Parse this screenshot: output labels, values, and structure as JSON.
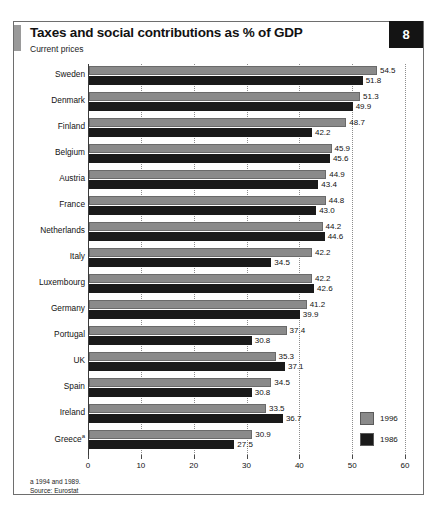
{
  "header": {
    "title": "Taxes and social contributions as % of GDP",
    "subtitle": "Current prices",
    "badge": "8"
  },
  "legend": {
    "items": [
      {
        "label": "1996",
        "color": "#8a8a8a"
      },
      {
        "label": "1986",
        "color": "#1a1a1a"
      }
    ]
  },
  "footnotes": {
    "note_a": "a  1994 and 1989.",
    "source": "Source: Eurostat"
  },
  "chart_data": {
    "type": "bar",
    "orientation": "horizontal",
    "title": "Taxes and social contributions as % of GDP",
    "subtitle": "Current prices",
    "xlabel": "",
    "ylabel": "",
    "xlim": [
      0,
      60
    ],
    "xticks": [
      0,
      10,
      20,
      30,
      40,
      50,
      60
    ],
    "grid": true,
    "grid_axis": "x",
    "legend_position": "bottom-right",
    "categories": [
      "Sweden",
      "Denmark",
      "Finland",
      "Belgium",
      "Austria",
      "France",
      "Netherlands",
      "Italy",
      "Luxembourg",
      "Germany",
      "Portugal",
      "UK",
      "Spain",
      "Ireland",
      "Greece"
    ],
    "category_footnote_marks": {
      "Greece": "a"
    },
    "series": [
      {
        "name": "1996",
        "color": "#8a8a8a",
        "values": [
          54.5,
          51.3,
          48.7,
          45.9,
          44.9,
          44.8,
          44.2,
          42.2,
          42.2,
          41.2,
          37.4,
          35.3,
          34.5,
          33.5,
          30.9
        ]
      },
      {
        "name": "1986",
        "color": "#1a1a1a",
        "values": [
          51.8,
          49.9,
          42.2,
          45.6,
          43.4,
          43.0,
          44.6,
          34.5,
          42.6,
          39.9,
          30.8,
          37.1,
          30.8,
          36.7,
          27.5
        ]
      }
    ]
  }
}
